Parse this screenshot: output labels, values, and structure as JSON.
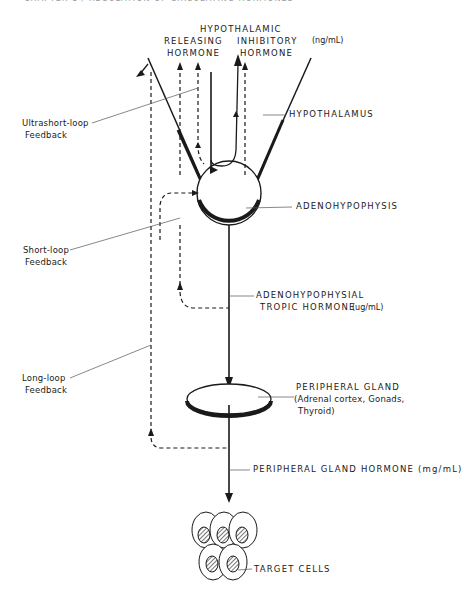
{
  "header": {
    "text": "CHAPTER 1 / REGULATION OF CIRCULATING HORMONES"
  },
  "labels": {
    "hypothalamic": "HYPOTHALAMIC",
    "releasing_line1": "RELEASING",
    "releasing_line2": "HORMONE",
    "inhibitory_line1": "INHIBITORY",
    "inhibitory_line2": "HORMONE",
    "hypothalamic_unit": "(ng/mL)",
    "hypothalamus": "HYPOTHALAMUS",
    "adenohypophysis": "ADENOHYPOPHYSIS",
    "tropic_line1": "ADENOHYPOPHYSIAL",
    "tropic_line2": "TROPIC HORMONE",
    "tropic_unit": "(ug/mL)",
    "peripheral_gland": "PERIPHERAL GLAND",
    "peripheral_gland_detail_line1": "(Adrenal cortex, Gonads,",
    "peripheral_gland_detail_line2": "Thyroid)",
    "peripheral_hormone": "PERIPHERAL GLAND HORMONE (mg/mL)",
    "target_cells": "TARGET CELLS"
  },
  "feedback": {
    "ultrashort_line1": "Ultrashort-loop",
    "ultrashort_line2": "Feedback",
    "short_line1": "Short-loop",
    "short_line2": "Feedback",
    "long_line1": "Long-loop",
    "long_line2": "Feedback"
  },
  "legend": {
    "solid_arrow": "secretion / stimulation",
    "dashed_arrow": "feedback"
  },
  "colors": {
    "ink": "#1a1a1a",
    "leader": "#555555",
    "background": "#ffffff"
  }
}
